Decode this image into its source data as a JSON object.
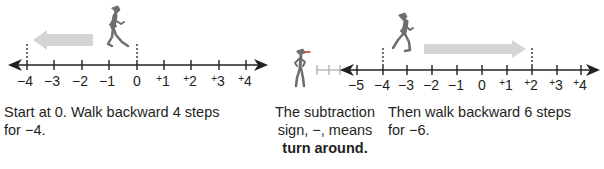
{
  "panels": [
    {
      "id": "start",
      "number_line": {
        "labels": [
          "−4",
          "−3",
          "−2",
          "−1",
          "0",
          "+1",
          "+2",
          "+3",
          "+4"
        ],
        "values": [
          -4,
          -3,
          -2,
          -1,
          0,
          1,
          2,
          3,
          4
        ],
        "marked_start": 0,
        "marked_end": -4,
        "arrow_direction": "left"
      },
      "caption_line1": "Start at 0. Walk backward 4 steps",
      "caption_line2_prefix": "for ",
      "caption_line2_value": "−4",
      "caption_line2_suffix": "."
    },
    {
      "id": "turn",
      "caption_line1": "The subtraction",
      "caption_line2": "sign, −, means",
      "caption_bold": "turn around."
    },
    {
      "id": "then",
      "number_line": {
        "labels": [
          "−5",
          "−4",
          "−3",
          "−2",
          "−1",
          "0",
          "+1",
          "+2",
          "+3",
          "+4"
        ],
        "values": [
          -5,
          -4,
          -3,
          -2,
          -1,
          0,
          1,
          2,
          3,
          4
        ],
        "marked_start": -4,
        "marked_end": 2,
        "arrow_direction": "right"
      },
      "caption_line1": "Then walk backward 6 steps",
      "caption_line2_prefix": "for ",
      "caption_line2_value": "−6",
      "caption_line2_suffix": "."
    }
  ],
  "colors": {
    "line": "#231f20",
    "figure": "#6d6e70",
    "motion_arrow": "#d4d5d6",
    "faded_line": "#b5b6b7"
  }
}
